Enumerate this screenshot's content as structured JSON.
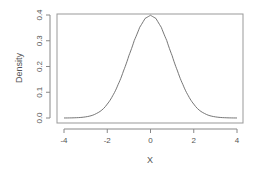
{
  "chart_data": {
    "type": "line",
    "title": "",
    "xlabel": "X",
    "ylabel": "Density",
    "xlim": [
      -4,
      4
    ],
    "ylim": [
      0,
      0.4
    ],
    "grid": false,
    "legend": null,
    "x_ticks": [
      -4,
      -2,
      0,
      2,
      4
    ],
    "x_tick_labels": [
      "-4",
      "-2",
      "0",
      "2",
      "4"
    ],
    "y_ticks": [
      0.0,
      0.1,
      0.2,
      0.3,
      0.4
    ],
    "y_tick_labels": [
      "0.0",
      "0.1",
      "0.2",
      "0.3",
      "0.4"
    ],
    "series": [
      {
        "name": "Standard normal density",
        "color": "#666666",
        "x": [
          -4,
          -3.5,
          -3,
          -2.5,
          -2,
          -1.75,
          -1.5,
          -1.25,
          -1,
          -0.75,
          -0.5,
          -0.25,
          0,
          0.25,
          0.5,
          0.75,
          1,
          1.25,
          1.5,
          1.75,
          2,
          2.5,
          3,
          3.5,
          4
        ],
        "y": [
          0.0001,
          0.0009,
          0.0044,
          0.0175,
          0.054,
          0.0863,
          0.1295,
          0.1826,
          0.242,
          0.3011,
          0.3521,
          0.3867,
          0.3989,
          0.3867,
          0.3521,
          0.3011,
          0.242,
          0.1826,
          0.1295,
          0.0863,
          0.054,
          0.0175,
          0.0044,
          0.0009,
          0.0001
        ]
      }
    ]
  },
  "colors": {
    "axis": "#888888",
    "curve": "#666666",
    "text": "#555555"
  }
}
